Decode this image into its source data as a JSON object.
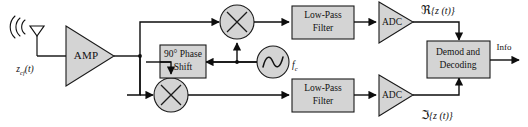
{
  "diagram": {
    "input": {
      "antenna_label": "antenna-icon",
      "signal_label_base": "z",
      "signal_label_sub": "cf",
      "signal_label_arg": "(t)",
      "signal_label_full": "z_cf(t)"
    },
    "amplifier": {
      "label": "AMP"
    },
    "phase_shift": {
      "line1": "90° Phase",
      "line2": "Shift",
      "full": "90° Phase Shift"
    },
    "oscillator": {
      "icon": "sine-wave-icon",
      "label_base": "f",
      "label_sub": "c",
      "label_full": "f_c"
    },
    "mixers": [
      {
        "id": "mixer-i",
        "icon": "multiplier-icon",
        "label": "×"
      },
      {
        "id": "mixer-q",
        "icon": "multiplier-icon",
        "label": "×"
      }
    ],
    "filters": [
      {
        "id": "lpf-i",
        "line1": "Low-Pass",
        "line2": "Filter",
        "full": "Low-Pass Filter"
      },
      {
        "id": "lpf-q",
        "line1": "Low-Pass",
        "line2": "Filter",
        "full": "Low-Pass Filter"
      }
    ],
    "adcs": [
      {
        "id": "adc-i",
        "label": "ADC"
      },
      {
        "id": "adc-q",
        "label": "ADC"
      }
    ],
    "branch_labels": {
      "real": {
        "operator": "ℜ",
        "arg": "{z (t)}",
        "full": "ℜ{z(t)}"
      },
      "imag": {
        "operator": "ℑ",
        "arg": "{z (t)}",
        "full": "ℑ{z(t)}"
      }
    },
    "demod": {
      "line1": "Demod and",
      "line2": "Decoding",
      "full": "Demod and Decoding"
    },
    "output": {
      "label": "Info"
    },
    "colors": {
      "block_fill": "#d4d4d4",
      "stroke": "#111111",
      "background": "#ffffff"
    }
  }
}
